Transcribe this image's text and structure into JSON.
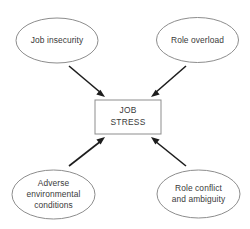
{
  "diagram": {
    "background_color": "#ffffff",
    "shape_stroke_color": "#8d8d8d",
    "arrow_color": "#1d1d1d",
    "text_color": "#3a3a3a",
    "center": {
      "shape": "rectangle",
      "line1": "JOB",
      "line2": "STRESS"
    },
    "sources": [
      {
        "id": "job-insecurity",
        "shape": "ellipse",
        "position": "top-left",
        "line1": "Job insecurity",
        "line2": "",
        "line3": ""
      },
      {
        "id": "role-overload",
        "shape": "ellipse",
        "position": "top-right",
        "line1": "Role overload",
        "line2": "",
        "line3": ""
      },
      {
        "id": "adverse-environmental-conditions",
        "shape": "ellipse",
        "position": "bottom-left",
        "line1": "Adverse",
        "line2": "environmental",
        "line3": "conditions"
      },
      {
        "id": "role-conflict-and-ambiguity",
        "shape": "ellipse",
        "position": "bottom-right",
        "line1": "Role conflict",
        "line2": "and ambiguity",
        "line3": ""
      }
    ]
  }
}
